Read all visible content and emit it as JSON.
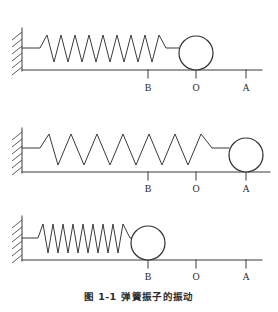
{
  "figure": {
    "caption_number": "图 1-1",
    "caption_text": "弹簧振子的振动",
    "line_color": "#3a3a3a",
    "ball_fill": "#ffffff",
    "background": "#ffffff"
  },
  "markers": {
    "b_label": "B",
    "o_label": "O",
    "a_label": "A",
    "b_x": 148,
    "o_x": 196,
    "a_x": 246
  },
  "panels": [
    {
      "id": "equilibrium",
      "state_label": "O",
      "ball_position_label": "O",
      "ball_center_x": 196,
      "ball_radius": 17,
      "spring_coils": 9,
      "spring_start_x": 40,
      "spring_end_x": 171,
      "spring_amplitude": 24,
      "baseline_y": 70,
      "wall_x": 22,
      "wall_top_y": 28,
      "axis_right_x": 262,
      "labels": {
        "b": "B",
        "o": "O",
        "a": "A"
      }
    },
    {
      "id": "stretched",
      "state_label": "A",
      "ball_position_label": "A",
      "ball_center_x": 246,
      "ball_radius": 17,
      "spring_coils": 8,
      "spring_start_x": 40,
      "spring_end_x": 220,
      "spring_amplitude": 26,
      "baseline_y": 72,
      "wall_x": 22,
      "wall_top_y": 30,
      "axis_right_x": 270,
      "labels": {
        "b": "B",
        "o": "O",
        "a": "A"
      }
    },
    {
      "id": "compressed",
      "state_label": "B",
      "ball_position_label": "B",
      "ball_center_x": 148,
      "ball_radius": 17,
      "spring_coils": 10,
      "spring_start_x": 38,
      "spring_end_x": 126,
      "spring_amplitude": 24,
      "baseline_y": 62,
      "wall_x": 22,
      "wall_top_y": 20,
      "axis_right_x": 262,
      "labels": {
        "b": "B",
        "o": "O",
        "a": "A"
      }
    }
  ]
}
